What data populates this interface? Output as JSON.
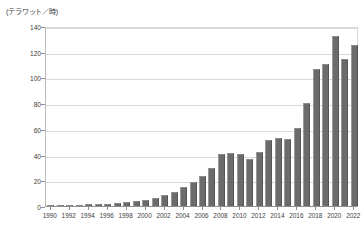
{
  "chart_data": {
    "type": "bar",
    "title": "",
    "subtitle": "",
    "unit_label": "(テラワット／時)",
    "xlabel": "",
    "ylabel": "",
    "ylim": [
      0,
      140
    ],
    "ytick_step": 20,
    "yticks": [
      0,
      20,
      40,
      60,
      80,
      100,
      120,
      140
    ],
    "ytick_labels": [
      "0",
      "20",
      "40",
      "60",
      "80",
      "100",
      "120",
      "140"
    ],
    "grid": true,
    "grid_axis": "y",
    "legend": false,
    "legend_position": "none",
    "xtick_interval_years": 2,
    "xtick_labels": [
      "1990",
      "1992",
      "1994",
      "1996",
      "1998",
      "2000",
      "2002",
      "2004",
      "2006",
      "2008",
      "2010",
      "2012",
      "2014",
      "2016",
      "2018",
      "2020",
      "2022"
    ],
    "categories": [
      "1990",
      "1991",
      "1992",
      "1993",
      "1994",
      "1995",
      "1996",
      "1997",
      "1998",
      "1999",
      "2000",
      "2001",
      "2002",
      "2003",
      "2004",
      "2005",
      "2006",
      "2007",
      "2008",
      "2009",
      "2010",
      "2011",
      "2012",
      "2013",
      "2014",
      "2015",
      "2016",
      "2017",
      "2018",
      "2019",
      "2020",
      "2021",
      "2022"
    ],
    "values": [
      0.4,
      0.6,
      0.8,
      1.0,
      1.3,
      1.6,
      1.9,
      2.4,
      3.0,
      3.8,
      5.0,
      6.5,
      8.5,
      11.0,
      14.5,
      18.5,
      23.0,
      29.5,
      40.5,
      41.0,
      40.5,
      36.5,
      42.0,
      51.5,
      53.0,
      52.0,
      61.0,
      80.0,
      106.5,
      110.5,
      132.0,
      114.0,
      125.0
    ],
    "bar_color": "#6b6b6b",
    "background_color": "#ffffff",
    "grid_color": "#d9d9d9",
    "axis_color": "#8f8f8f"
  }
}
